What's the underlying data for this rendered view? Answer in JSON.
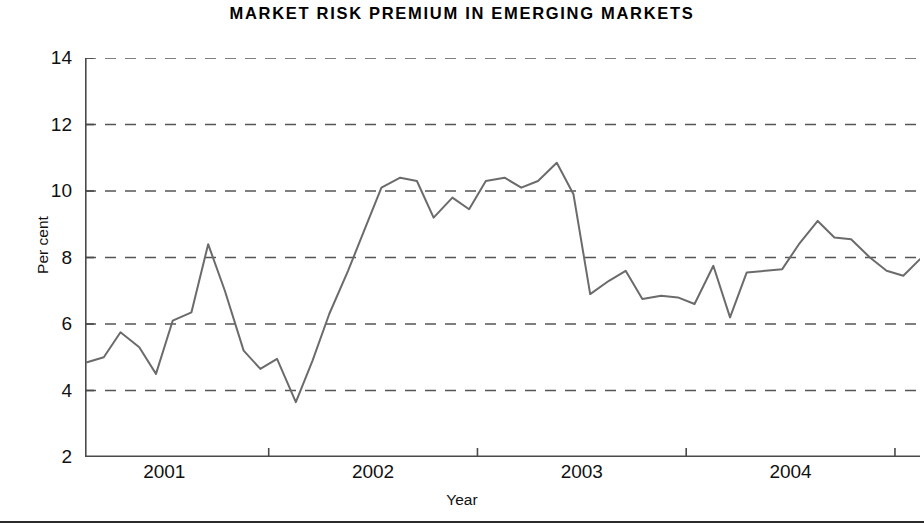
{
  "chart_data": {
    "type": "line",
    "title": "MARKET  RISK  PREMIUM  IN  EMERGING  MARKETS",
    "xlabel": "Year",
    "ylabel": "Per cent",
    "ylim": [
      2,
      14
    ],
    "xlim": [
      2000.62,
      2004.62
    ],
    "grid": "horizontal-dashed",
    "legend": "none",
    "yticks": [
      2,
      4,
      6,
      8,
      10,
      12,
      14
    ],
    "ytick_labels": [
      "2",
      "4",
      "6",
      "8",
      "10",
      "12",
      "14"
    ],
    "xticks": [
      2001.5,
      2002.5,
      2003.5,
      2004.5
    ],
    "xtick_labels": [
      "",
      "",
      "",
      ""
    ],
    "xcategory_labels": [
      {
        "label": "2001",
        "at": 2001.0
      },
      {
        "label": "2002",
        "at": 2002.0
      },
      {
        "label": "2003",
        "at": 2003.0
      },
      {
        "label": "2004",
        "at": 2004.0
      }
    ],
    "line_color": "#6b6b6b",
    "line_width": 2.0,
    "series": [
      {
        "name": "Market risk premium",
        "x": [
          2000.63,
          2000.71,
          2000.79,
          2000.88,
          2000.96,
          2001.04,
          2001.13,
          2001.21,
          2001.29,
          2001.38,
          2001.46,
          2001.54,
          2001.63,
          2001.71,
          2001.79,
          2001.88,
          2001.96,
          2002.04,
          2002.13,
          2002.21,
          2002.29,
          2002.38,
          2002.46,
          2002.54,
          2002.63,
          2002.71,
          2002.79,
          2002.88,
          2002.96,
          2003.04,
          2003.13,
          2003.21,
          2003.29,
          2003.38,
          2003.46,
          2003.54,
          2003.63,
          2003.71,
          2003.79,
          2003.88,
          2003.96,
          2004.04,
          2004.13,
          2004.21,
          2004.29,
          2004.38,
          2004.46,
          2004.54,
          2004.62
        ],
        "values": [
          4.85,
          5.0,
          5.75,
          5.3,
          4.5,
          6.1,
          6.35,
          8.4,
          7.0,
          5.2,
          4.65,
          4.95,
          3.65,
          4.9,
          6.3,
          7.6,
          8.85,
          10.1,
          10.4,
          10.3,
          9.2,
          9.8,
          9.45,
          10.3,
          10.4,
          10.1,
          10.3,
          10.85,
          9.9,
          6.9,
          7.3,
          7.6,
          6.75,
          6.85,
          6.8,
          6.6,
          7.75,
          6.2,
          7.55,
          7.6,
          7.65,
          8.4,
          9.1,
          8.6,
          8.55,
          8.0,
          7.6,
          7.45,
          7.95
        ]
      }
    ]
  },
  "axes": {
    "y_label": "Per cent",
    "x_label": "Year"
  }
}
